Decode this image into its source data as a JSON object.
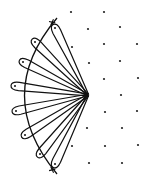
{
  "diagram": {
    "stroke_color": "#111111",
    "dot_color": "#222222",
    "background": "#ffffff",
    "hub": {
      "x": 88,
      "y": 95
    },
    "arc": {
      "start": {
        "x": 57,
        "y": 18
      },
      "control": {
        "x": -8,
        "y": 95
      },
      "end": {
        "x": 57,
        "y": 174
      }
    },
    "loops": [
      {
        "x": 55,
        "y": 28,
        "cross": true
      },
      {
        "x": 35,
        "y": 42
      },
      {
        "x": 23,
        "y": 62
      },
      {
        "x": 15,
        "y": 86
      },
      {
        "x": 16,
        "y": 111
      },
      {
        "x": 25,
        "y": 135
      },
      {
        "x": 40,
        "y": 154
      },
      {
        "x": 55,
        "y": 164,
        "cross": true
      }
    ],
    "dots": [
      {
        "x": 71,
        "y": 12
      },
      {
        "x": 104,
        "y": 12
      },
      {
        "x": 88,
        "y": 29
      },
      {
        "x": 120,
        "y": 27
      },
      {
        "x": 72,
        "y": 47
      },
      {
        "x": 104,
        "y": 44
      },
      {
        "x": 137,
        "y": 44
      },
      {
        "x": 89,
        "y": 63
      },
      {
        "x": 120,
        "y": 61
      },
      {
        "x": 104,
        "y": 79
      },
      {
        "x": 138,
        "y": 78
      },
      {
        "x": 121,
        "y": 95
      },
      {
        "x": 105,
        "y": 112
      },
      {
        "x": 137,
        "y": 111
      },
      {
        "x": 87,
        "y": 128
      },
      {
        "x": 122,
        "y": 128
      },
      {
        "x": 72,
        "y": 146
      },
      {
        "x": 105,
        "y": 146
      },
      {
        "x": 138,
        "y": 145
      },
      {
        "x": 89,
        "y": 163
      },
      {
        "x": 122,
        "y": 163
      }
    ]
  }
}
